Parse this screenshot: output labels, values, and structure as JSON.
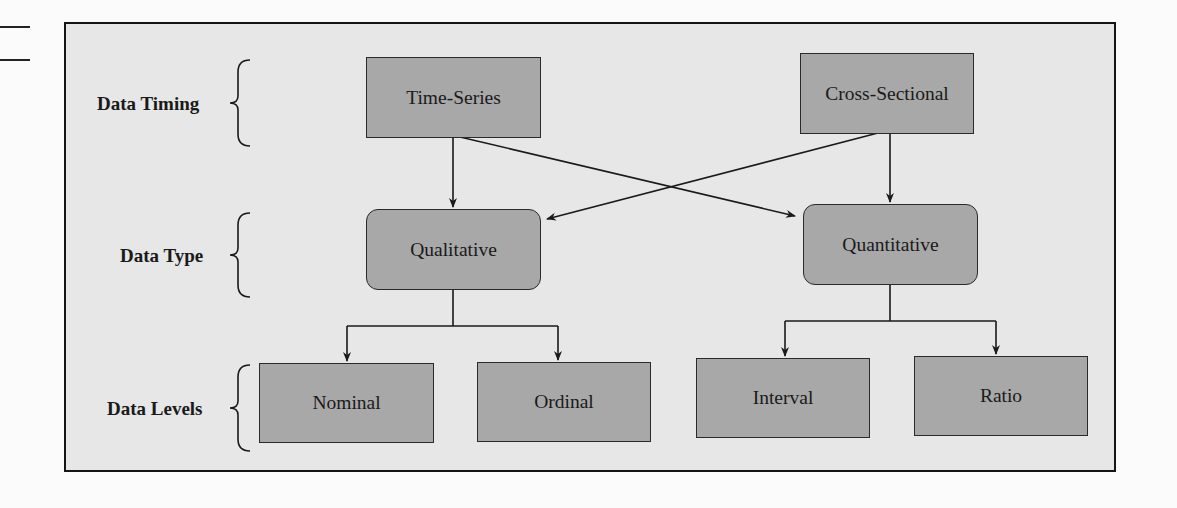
{
  "diagram": {
    "rows": [
      {
        "id": "timing",
        "label": "Data Timing"
      },
      {
        "id": "type",
        "label": "Data Type"
      },
      {
        "id": "levels",
        "label": "Data Levels"
      }
    ],
    "nodes": {
      "time_series": "Time-Series",
      "cross_sectional": "Cross-Sectional",
      "qualitative": "Qualitative",
      "quantitative": "Quantitative",
      "nominal": "Nominal",
      "ordinal": "Ordinal",
      "interval": "Interval",
      "ratio": "Ratio"
    },
    "edges": [
      {
        "from": "Time-Series",
        "to": "Qualitative"
      },
      {
        "from": "Time-Series",
        "to": "Quantitative"
      },
      {
        "from": "Cross-Sectional",
        "to": "Qualitative"
      },
      {
        "from": "Cross-Sectional",
        "to": "Quantitative"
      },
      {
        "from": "Qualitative",
        "to": "Nominal"
      },
      {
        "from": "Qualitative",
        "to": "Ordinal"
      },
      {
        "from": "Quantitative",
        "to": "Interval"
      },
      {
        "from": "Quantitative",
        "to": "Ratio"
      }
    ],
    "colors": {
      "box_fill": "#a8a8a8",
      "panel_background": "#e7e7e7",
      "stroke": "#1a1a1a"
    }
  }
}
